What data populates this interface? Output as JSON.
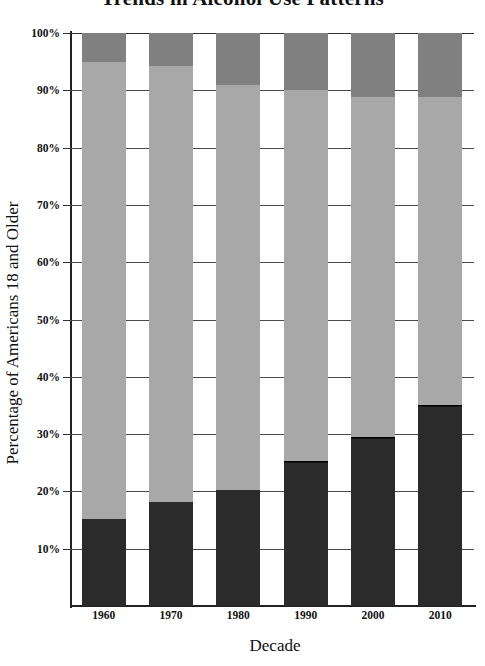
{
  "chart_data": {
    "type": "bar",
    "stacked": true,
    "orientation": "vertical",
    "title": "Trends in Alcohol Use Patterns",
    "xlabel": "Decade",
    "ylabel": "Percentage of Americans 18 and Older",
    "categories": [
      "1960",
      "1970",
      "1980",
      "1990",
      "2000",
      "2010"
    ],
    "ylim": [
      0,
      100
    ],
    "ytick_labels": [
      "10%",
      "20%",
      "30%",
      "40%",
      "50%",
      "60%",
      "70%",
      "80%",
      "90%",
      "100%"
    ],
    "ytick_values": [
      10,
      20,
      30,
      40,
      50,
      60,
      70,
      80,
      90,
      100
    ],
    "grid": true,
    "legend": "none",
    "series": [
      {
        "name": "Abstainers",
        "color": "#2b2b2b",
        "values": [
          15.1,
          18.2,
          20.2,
          22.5,
          22.5,
          27.4
        ]
      },
      {
        "name": "Former drinkers",
        "color": "#2b2b2b",
        "values": [
          0.0,
          0.0,
          0.0,
          2.8,
          7.0,
          7.6
        ]
      },
      {
        "name": "Current drinkers",
        "color": "#a8a8a8",
        "values": [
          79.9,
          76.1,
          70.7,
          64.7,
          59.4,
          53.1
        ]
      },
      {
        "name": "Heavy drinkers",
        "color": "#808080",
        "values": [
          5.0,
          5.7,
          9.1,
          10.0,
          11.1,
          11.9
        ]
      }
    ],
    "segment_tops": {
      "1960": [
        15.1,
        15.1,
        95.0,
        100.0
      ],
      "1970": [
        18.2,
        18.2,
        94.3,
        100.0
      ],
      "1980": [
        20.2,
        20.2,
        90.9,
        100.0
      ],
      "1990": [
        22.5,
        25.3,
        90.0,
        100.0
      ],
      "2000": [
        22.5,
        29.5,
        88.9,
        100.0
      ],
      "2010": [
        27.4,
        35.0,
        88.9,
        100.0
      ]
    }
  },
  "colors": {
    "dark": "#2b2b2b",
    "light_gray": "#a8a8a8",
    "mid_gray": "#808080",
    "axis": "#222222",
    "grid": "#4a4a4a",
    "background": "#ffffff",
    "text": "#111111"
  }
}
